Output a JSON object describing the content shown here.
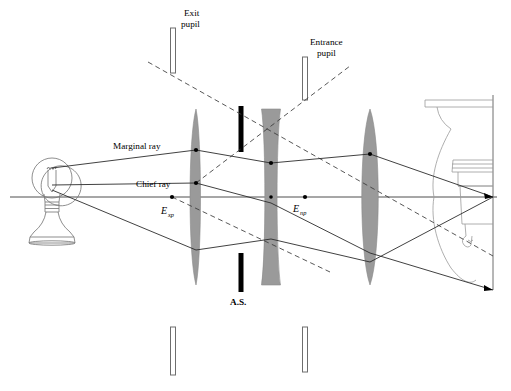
{
  "figure": {
    "width": 511,
    "height": 391,
    "background": "#ffffff"
  },
  "colors": {
    "ink": "#000000",
    "ray": "#2b2b2b",
    "lens_fill": "#9a9a9a",
    "lens_stroke": "#8a8a8a",
    "stop_black": "#000000",
    "pupil_outline": "#6e6e6e",
    "pupil_fill": "#ffffff",
    "bulb_outline": "#7a7a7a",
    "axis": "#3a3a3a"
  },
  "labels": {
    "exit_pupil_line1": "Exit",
    "exit_pupil_line2": "pupil",
    "entrance_pupil_line1": "Entrance",
    "entrance_pupil_line2": "pupil",
    "marginal_ray": "Marginal ray",
    "chief_ray": "Chief ray",
    "aperture_stop": "A.S.",
    "exit_pupil_point_base": "E",
    "exit_pupil_point_sub": "xp",
    "entrance_pupil_point_base": "E",
    "entrance_pupil_point_sub": "np"
  },
  "optical_axis": {
    "y": 197,
    "x_start": 10,
    "x_end": 497
  },
  "elements": {
    "lens1": {
      "name": "first-lens-positive-meniscus",
      "center_x": 196,
      "center_y": 197,
      "half_height": 88,
      "max_half_width": 5.5,
      "type": "meniscus-convex"
    },
    "lens2": {
      "name": "second-lens-biconcave",
      "center_x": 271,
      "center_y": 197,
      "half_height": 88,
      "edge_half_width": 9.5,
      "waist_half_width": 4.0,
      "type": "biconcave"
    },
    "lens3": {
      "name": "third-lens-biconvex",
      "center_x": 370,
      "center_y": 197,
      "half_height": 88,
      "max_half_width": 11,
      "type": "biconvex"
    },
    "aperture_stop": {
      "name": "aperture-stop-bars",
      "x": 241,
      "upper_y_top": 106,
      "upper_y_bottom": 152,
      "lower_y_top": 253,
      "lower_y_bottom": 292,
      "width": 5
    },
    "exit_pupil_bar": {
      "name": "exit-pupil-bars",
      "x": 173,
      "upper_y_top": 28,
      "upper_y_bottom": 73,
      "lower_y_top": 327,
      "lower_y_bottom": 375,
      "width": 5
    },
    "entrance_pupil_bar": {
      "name": "entrance-pupil-bars",
      "x": 305,
      "upper_y_top": 57,
      "upper_y_bottom": 100,
      "lower_y_top": 327,
      "lower_y_bottom": 372,
      "width": 5
    },
    "image_plane": {
      "name": "image-plane-screen",
      "x": 493,
      "y_top": 95,
      "y_bottom": 290
    }
  },
  "points": {
    "exit_pupil_point": {
      "x": 172,
      "y": 197
    },
    "entrance_pupil_point": {
      "x": 305,
      "y": 197
    },
    "axis_mid_point": {
      "x": 271,
      "y": 197
    },
    "image_point": {
      "x": 493,
      "y": 197
    }
  },
  "rays": {
    "marginal_ray_upper": [
      {
        "x": 52,
        "y": 168
      },
      {
        "x": 196,
        "y": 150
      },
      {
        "x": 271,
        "y": 163
      },
      {
        "x": 370,
        "y": 154
      },
      {
        "x": 493,
        "y": 197
      }
    ],
    "marginal_ray_lower": [
      {
        "x": 52,
        "y": 190
      },
      {
        "x": 196,
        "y": 250
      },
      {
        "x": 271,
        "y": 239
      },
      {
        "x": 370,
        "y": 262
      },
      {
        "x": 493,
        "y": 197
      }
    ],
    "chief_ray": [
      {
        "x": 52,
        "y": 183
      },
      {
        "x": 196,
        "y": 183
      },
      {
        "x": 271,
        "y": 203
      },
      {
        "x": 370,
        "y": 253
      },
      {
        "x": 493,
        "y": 290
      }
    ],
    "dashed_construction_1": [
      {
        "x": 148,
        "y": 62
      },
      {
        "x": 493,
        "y": 255
      }
    ],
    "dashed_construction_2": [
      {
        "x": 196,
        "y": 183
      },
      {
        "x": 305,
        "y": 197
      },
      {
        "x": 345,
        "y": 70
      }
    ]
  },
  "label_positions": {
    "exit_pupil": {
      "x": 184,
      "y": 16
    },
    "entrance_pupil": {
      "x": 310,
      "y": 45
    },
    "marginal_ray": {
      "x": 113,
      "y": 149
    },
    "chief_ray": {
      "x": 136,
      "y": 186
    },
    "aperture_stop": {
      "x": 234,
      "y": 305
    },
    "exit_pupil_point": {
      "x": 162,
      "y": 214
    },
    "entrance_pupil_point": {
      "x": 294,
      "y": 212
    }
  }
}
